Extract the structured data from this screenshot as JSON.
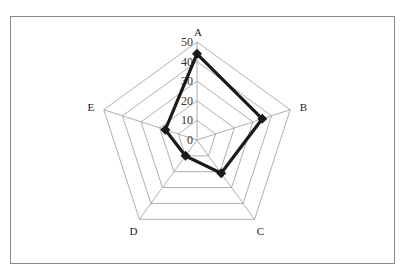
{
  "chart_data": {
    "type": "radar",
    "title": "",
    "categories": [
      "A",
      "B",
      "C",
      "D",
      "E"
    ],
    "series": [
      {
        "name": "Series 1",
        "values": [
          44,
          35,
          21,
          10,
          17
        ],
        "color": "#1a1a1a",
        "marker": "diamond"
      }
    ],
    "rlim": [
      0,
      50
    ],
    "ticks": [
      "0",
      "10",
      "20",
      "30",
      "40",
      "50"
    ],
    "grid": true,
    "legend": "none"
  }
}
